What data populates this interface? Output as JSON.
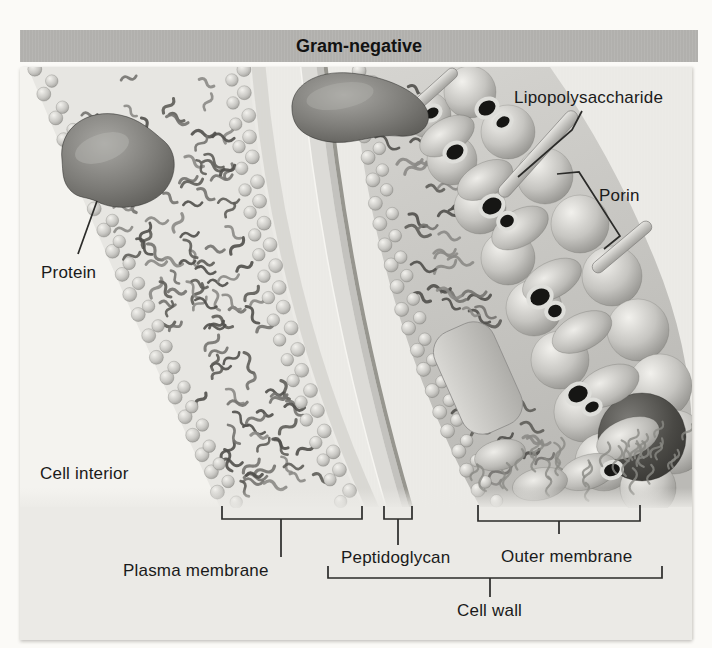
{
  "figure": {
    "title": "Gram-negative",
    "labels": {
      "lipopolysaccharide": "Lipopolysaccharide",
      "porin": "Porin",
      "protein": "Protein",
      "cell_interior": "Cell interior",
      "plasma_membrane": "Plasma membrane",
      "peptidoglycan": "Peptidoglycan",
      "outer_membrane": "Outer membrane",
      "cell_wall": "Cell wall"
    },
    "colors": {
      "page": "#fbfaf7",
      "banner": "#b1b0ad",
      "panel": "#ebeae6",
      "interior": "#f4f3ef",
      "ink": "#2b2b29",
      "text": "#1a1a1a"
    }
  }
}
